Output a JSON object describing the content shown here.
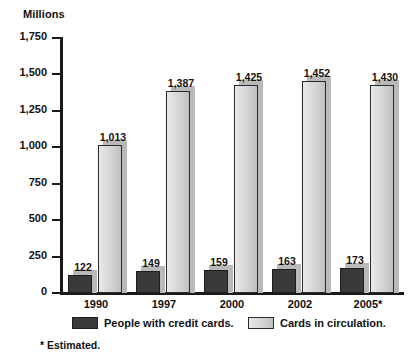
{
  "chart_data": {
    "type": "bar",
    "title": "",
    "subtitle": "",
    "units_label": "Millions",
    "xlabel": "",
    "ylabel": "Millions",
    "ylim": [
      0,
      1750
    ],
    "ytick_step": 250,
    "grid": false,
    "legend_position": "bottom",
    "categories": [
      "1990",
      "1997",
      "2000",
      "2002",
      "2005*"
    ],
    "ytick_labels": [
      "0",
      "250",
      "500",
      "750",
      "1,000",
      "1,250",
      "1,500",
      "1,750"
    ],
    "ytick_values": [
      0,
      250,
      500,
      750,
      1000,
      1250,
      1500,
      1750
    ],
    "series": [
      {
        "name": "People with credit cards.",
        "color": "#3a3a3a",
        "values": [
          122,
          149,
          159,
          163,
          173
        ],
        "value_labels": [
          "122",
          "149",
          "159",
          "163",
          "173"
        ]
      },
      {
        "name": "Cards in circulation.",
        "color": "#d6d6d6",
        "values": [
          1013,
          1387,
          1425,
          1452,
          1430
        ],
        "value_labels": [
          "1,013",
          "1,387",
          "1,425",
          "1,452",
          "1,430"
        ]
      }
    ],
    "annotations": [
      "* Estimated."
    ]
  },
  "footnote": "* Estimated."
}
